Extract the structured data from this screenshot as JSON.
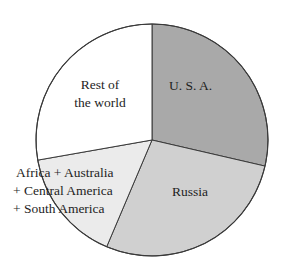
{
  "chart_data": {
    "type": "pie",
    "title": "",
    "start_angle_deg": 0,
    "direction": "clockwise",
    "categories": [
      "U. S. A.",
      "Russia",
      "Africa + Australia + Central America + South America",
      "Rest of the world"
    ],
    "values": [
      28.6,
      27.8,
      15.8,
      27.8
    ],
    "unit": "percent (estimated from slice angles)",
    "slices": [
      {
        "label": "U. S. A.",
        "value": 28.6,
        "start_deg": 0,
        "end_deg": 103,
        "color": "#a9a9a9"
      },
      {
        "label": "Russia",
        "value": 27.8,
        "start_deg": 103,
        "end_deg": 203,
        "color": "#d0d0d0"
      },
      {
        "label": "Africa + Australia + Central America + South America",
        "value": 15.8,
        "start_deg": 203,
        "end_deg": 260,
        "color": "#ebebeb"
      },
      {
        "label": "Rest of the world",
        "value": 27.8,
        "start_deg": 260,
        "end_deg": 360,
        "color": "#ffffff"
      }
    ],
    "legend": "none (labels placed inside slices)",
    "grid": false
  },
  "labels": {
    "usa": "U. S. A.",
    "russia": "Russia",
    "rest_line1": "Rest of",
    "rest_line2": "the world",
    "africa_line1": "Africa + Australia",
    "africa_line2": "+ Central America",
    "africa_line3": "+ South America"
  },
  "colors": {
    "usa": "#a9a9a9",
    "russia": "#d0d0d0",
    "africa": "#ebebeb",
    "rest": "#ffffff",
    "stroke": "#3a3a3a",
    "text": "#1e1e1e"
  }
}
